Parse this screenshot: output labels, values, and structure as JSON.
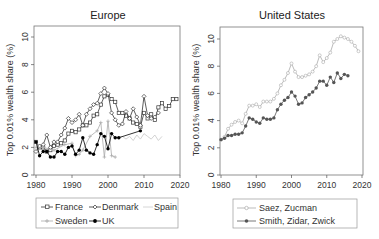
{
  "chart_data": [
    {
      "type": "line",
      "title": "Europe",
      "xlabel": "",
      "ylabel": "Top 0.01% wealth share (%)",
      "xlim": [
        1979,
        2021
      ],
      "ylim": [
        0,
        11
      ],
      "xticks": [
        1980,
        1990,
        2000,
        2010,
        2020
      ],
      "yticks": [
        0,
        2,
        4,
        6,
        8,
        10
      ],
      "grid": false,
      "legend_position": "bottom",
      "series": [
        {
          "name": "France",
          "marker": "square-open",
          "color": "#333333",
          "x": [
            1980,
            1981,
            1982,
            1983,
            1984,
            1985,
            1986,
            1987,
            1988,
            1989,
            1990,
            1991,
            1992,
            1993,
            1994,
            1995,
            1996,
            1997,
            1998,
            1999,
            2000,
            2001,
            2002,
            2003,
            2004,
            2005,
            2006,
            2007,
            2008,
            2009,
            2010,
            2011,
            2012,
            2013,
            2014,
            2015,
            2016,
            2017,
            2018,
            2019
          ],
          "y": [
            2.4,
            2.0,
            2.0,
            1.7,
            1.8,
            2.1,
            2.2,
            2.3,
            2.5,
            3.0,
            3.2,
            3.1,
            3.3,
            3.6,
            3.6,
            3.8,
            4.3,
            4.4,
            5.1,
            5.7,
            5.8,
            5.5,
            5.3,
            4.5,
            4.5,
            4.3,
            4.1,
            3.8,
            3.7,
            3.5,
            4.5,
            4.1,
            4.4,
            4.0,
            4.9,
            5.2,
            4.8,
            5.0,
            5.5,
            5.5
          ]
        },
        {
          "name": "Denmark",
          "marker": "diamond-open",
          "color": "#333333",
          "x": [
            1980,
            1981,
            1982,
            1983,
            1984,
            1985,
            1986,
            1987,
            1988,
            1989,
            1990,
            1991,
            1992,
            1993,
            1994,
            1995,
            1996,
            1997,
            1998,
            1999,
            2000,
            2001,
            2002,
            2003,
            2004,
            2005,
            2006,
            2007,
            2008,
            2009,
            2010,
            2011,
            2012,
            2013,
            2014
          ],
          "y": [
            1.7,
            2.1,
            2.2,
            2.9,
            2.0,
            2.4,
            2.4,
            2.9,
            3.4,
            4.1,
            3.8,
            4.0,
            4.4,
            3.6,
            4.4,
            4.8,
            5.1,
            5.2,
            5.9,
            6.3,
            5.9,
            4.5,
            4.0,
            3.6,
            3.7,
            4.6,
            4.1,
            4.8,
            4.2,
            3.6,
            5.7,
            4.3,
            4.1,
            4.2,
            4.5
          ]
        },
        {
          "name": "Spain",
          "marker": "none",
          "color": "#c8c8c8",
          "x": [
            2002,
            2003,
            2004,
            2005,
            2006,
            2007,
            2008,
            2009,
            2010,
            2011,
            2012,
            2013,
            2014,
            2015
          ],
          "y": [
            2.8,
            2.7,
            2.8,
            2.6,
            2.8,
            2.5,
            2.9,
            2.6,
            3.0,
            2.8,
            2.6,
            2.9,
            2.5,
            2.8
          ]
        },
        {
          "name": "Sweden",
          "marker": "plus",
          "color": "#aaaaaa",
          "x": [
            1980,
            1982,
            1985,
            1988,
            1990,
            1991,
            1992,
            1993,
            1995,
            1997,
            1998,
            1999,
            2000,
            2001,
            2002
          ],
          "y": [
            2.0,
            2.0,
            1.8,
            2.2,
            2.3,
            1.4,
            1.5,
            1.8,
            2.8,
            3.2,
            3.8,
            1.3,
            3.9,
            1.4,
            1.3
          ]
        },
        {
          "name": "UK",
          "marker": "circle-filled",
          "color": "#000000",
          "x": [
            1980,
            1981,
            1982,
            1983,
            1984,
            1985,
            1986,
            1987,
            1988,
            1989,
            1990,
            1991,
            1992,
            1993,
            1994,
            1995,
            1996,
            1997,
            1998,
            1999,
            2000,
            2001,
            2002,
            2003,
            2009
          ],
          "y": [
            2.4,
            1.4,
            1.7,
            1.7,
            1.3,
            1.3,
            1.7,
            1.7,
            1.5,
            2.0,
            2.1,
            1.5,
            1.8,
            2.7,
            1.8,
            1.6,
            1.5,
            2.2,
            3.0,
            2.8,
            1.9,
            3.0,
            2.7,
            2.7,
            3.2
          ]
        }
      ]
    },
    {
      "type": "line",
      "title": "United States",
      "xlabel": "",
      "ylabel": "Top 0.01% wealth share (%)",
      "xlim": [
        1979,
        2021
      ],
      "ylim": [
        0,
        11
      ],
      "xticks": [
        1980,
        1990,
        2000,
        2010,
        2020
      ],
      "yticks": [
        0,
        2,
        4,
        6,
        8,
        10
      ],
      "grid": false,
      "legend_position": "bottom",
      "series": [
        {
          "name": "Saez, Zucman",
          "marker": "circle-open",
          "color": "#aaaaaa",
          "x": [
            1980,
            1981,
            1982,
            1983,
            1984,
            1985,
            1986,
            1987,
            1988,
            1989,
            1990,
            1991,
            1992,
            1993,
            1994,
            1995,
            1996,
            1997,
            1998,
            1999,
            2000,
            2001,
            2002,
            2003,
            2004,
            2005,
            2006,
            2007,
            2008,
            2009,
            2010,
            2011,
            2012,
            2013,
            2014,
            2015,
            2016,
            2017,
            2018,
            2019
          ],
          "y": [
            2.6,
            2.8,
            3.4,
            3.7,
            3.9,
            4.0,
            3.8,
            4.5,
            5.1,
            5.1,
            5.2,
            5.0,
            5.4,
            5.4,
            5.4,
            5.6,
            6.0,
            6.6,
            7.0,
            7.5,
            8.2,
            7.6,
            7.2,
            7.2,
            7.3,
            7.4,
            7.6,
            8.0,
            8.8,
            8.3,
            8.6,
            9.0,
            9.8,
            10.0,
            10.2,
            10.1,
            10.0,
            9.8,
            9.5,
            9.1
          ]
        },
        {
          "name": "Smith, Zidar, Zwick",
          "marker": "circle-filled",
          "color": "#555555",
          "x": [
            1980,
            1981,
            1982,
            1983,
            1984,
            1985,
            1986,
            1987,
            1988,
            1989,
            1990,
            1991,
            1992,
            1993,
            1994,
            1995,
            1996,
            1997,
            1998,
            1999,
            2000,
            2001,
            2002,
            2003,
            2004,
            2005,
            2006,
            2007,
            2008,
            2009,
            2010,
            2011,
            2012,
            2013,
            2014,
            2015,
            2016
          ],
          "y": [
            2.6,
            2.7,
            2.9,
            2.9,
            3.0,
            3.0,
            3.1,
            3.6,
            4.2,
            4.1,
            3.9,
            3.8,
            4.2,
            4.1,
            4.1,
            4.2,
            4.8,
            5.2,
            5.5,
            5.7,
            6.1,
            5.8,
            5.2,
            5.3,
            5.7,
            5.9,
            6.1,
            6.4,
            6.9,
            6.9,
            6.6,
            7.2,
            6.8,
            7.5,
            7.1,
            7.4,
            7.3
          ]
        }
      ]
    }
  ],
  "panels": {
    "left": {
      "title": "Europe",
      "ylabel": "Top 0.01% wealth share (%)",
      "xticks": [
        "1980",
        "1990",
        "2000",
        "2010",
        "2020"
      ],
      "yticks": [
        "0",
        "2",
        "4",
        "6",
        "8",
        "10"
      ],
      "legend": [
        {
          "label": "France"
        },
        {
          "label": "Denmark"
        },
        {
          "label": "Spain"
        },
        {
          "label": "Sweden"
        },
        {
          "label": "UK"
        }
      ]
    },
    "right": {
      "title": "United States",
      "ylabel": "Top 0.01% wealth share (%)",
      "xticks": [
        "1980",
        "1990",
        "2000",
        "2010",
        "2020"
      ],
      "yticks": [
        "0",
        "2",
        "4",
        "6",
        "8",
        "10"
      ],
      "legend": [
        {
          "label": "Saez, Zucman"
        },
        {
          "label": "Smith, Zidar, Zwick"
        }
      ]
    }
  }
}
